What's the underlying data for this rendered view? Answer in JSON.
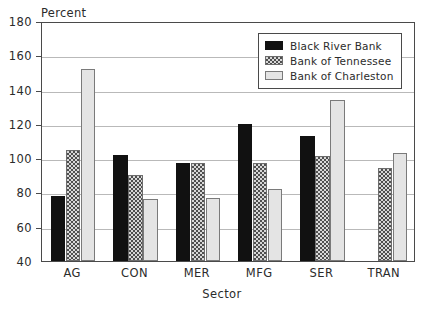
{
  "chart_data": {
    "type": "bar",
    "title": "",
    "xlabel": "Sector",
    "ylabel": "Percent",
    "categories": [
      "AG",
      "CON",
      "MER",
      "MFG",
      "SER",
      "TRAN"
    ],
    "series": [
      {
        "name": "Black River Bank",
        "values": [
          78,
          102,
          97,
          120,
          113,
          null
        ],
        "color": "#111111",
        "pattern": "solid"
      },
      {
        "name": "Bank of Tennessee",
        "values": [
          105,
          90,
          97,
          97,
          101,
          94
        ],
        "color": "#d8d8d8",
        "pattern": "checker"
      },
      {
        "name": "Bank of Charleston",
        "values": [
          152,
          76,
          77,
          82,
          134,
          103
        ],
        "color": "#e4e4e4",
        "pattern": "light"
      }
    ],
    "ylim": [
      40,
      180
    ],
    "yticks": [
      40,
      60,
      80,
      100,
      120,
      140,
      160,
      180
    ],
    "ytick_labels": [
      "40",
      "60",
      "80",
      "100",
      "120",
      "140",
      "160",
      "180"
    ],
    "grid": true,
    "legend_position": "top-right"
  },
  "axis": {
    "y_title": "Percent",
    "x_title": "Sector"
  },
  "legend": {
    "entries": [
      {
        "label": "Black River Bank"
      },
      {
        "label": "Bank of Tennessee"
      },
      {
        "label": "Bank of Charleston"
      }
    ]
  }
}
